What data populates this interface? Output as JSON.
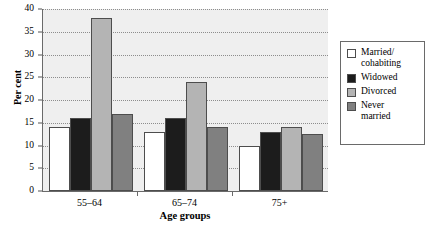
{
  "chart_data": {
    "type": "bar",
    "title": "",
    "xlabel": "Age groups",
    "ylabel": "Per cent",
    "categories": [
      "55–64",
      "65–74",
      "75+"
    ],
    "ylim": [
      0,
      40
    ],
    "yticks": [
      0,
      5,
      10,
      15,
      20,
      25,
      30,
      35,
      40
    ],
    "ytick_labels": [
      "0",
      "5",
      "10",
      "15",
      "20",
      "25",
      "30",
      "35",
      "40"
    ],
    "grid": true,
    "legend_position": "right",
    "series": [
      {
        "name": "Married/\ncohabiting",
        "color": "#ffffff",
        "values": [
          14,
          13,
          10
        ]
      },
      {
        "name": "Widowed",
        "color": "#1c1c1c",
        "values": [
          16,
          16,
          13
        ]
      },
      {
        "name": "Divorced",
        "color": "#b4b4b4",
        "values": [
          38,
          24,
          14
        ]
      },
      {
        "name": "Never\nmarried",
        "color": "#808080",
        "values": [
          17,
          14,
          12.5
        ]
      }
    ]
  },
  "legend": {
    "items": [
      {
        "label": "Married/\ncohabiting",
        "color": "#ffffff"
      },
      {
        "label": "Widowed",
        "color": "#1c1c1c"
      },
      {
        "label": "Divorced",
        "color": "#b4b4b4"
      },
      {
        "label": "Never\nmarried",
        "color": "#808080"
      }
    ]
  }
}
